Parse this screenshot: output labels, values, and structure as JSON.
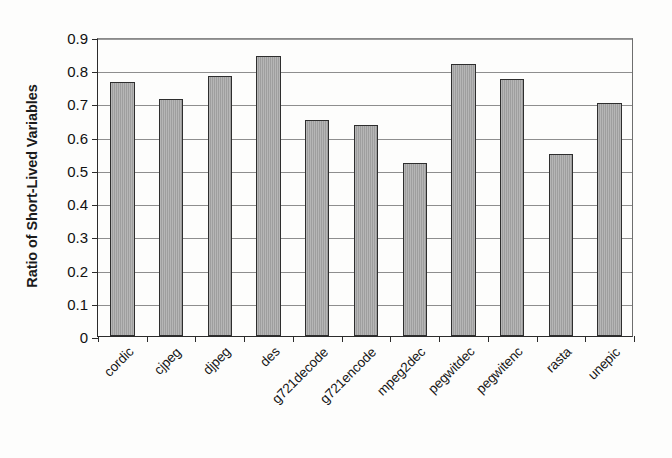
{
  "chart_data": {
    "type": "bar",
    "title": "",
    "xlabel": "",
    "ylabel": "Ratio of Short-Lived Variables",
    "ylim": [
      0,
      0.9
    ],
    "ytick_labels": [
      "0.9",
      "0.8",
      "0.7",
      "0.6",
      "0.5",
      "0.4",
      "0.3",
      "0.2",
      "0.1",
      "0"
    ],
    "ytick_values": [
      0.9,
      0.8,
      0.7,
      0.6,
      0.5,
      0.4,
      0.3,
      0.2,
      0.1,
      0
    ],
    "grid": true,
    "legend": false,
    "legend_position": "none",
    "bar_fill_color": "#a6a6a6",
    "bar_border_color": "#2e2e2e",
    "categories": [
      "cordic",
      "cjpeg",
      "djpeg",
      "des",
      "g721decode",
      "g721encode",
      "mpeg2dec",
      "pegwitdec",
      "pegwitenc",
      "rasta",
      "unepic"
    ],
    "values": [
      0.765,
      0.713,
      0.784,
      0.843,
      0.649,
      0.636,
      0.522,
      0.818,
      0.775,
      0.547,
      0.7
    ]
  }
}
